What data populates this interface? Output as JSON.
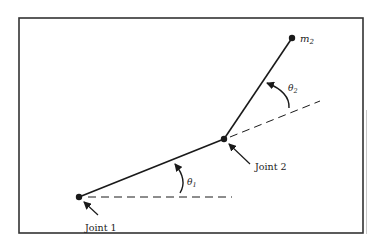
{
  "diagram": {
    "labels": {
      "joint1": "Joint 1",
      "joint2": "Joint 2",
      "mass": "m",
      "mass_sub": "2",
      "theta1": "θ",
      "theta1_sub": "1",
      "theta2": "θ",
      "theta2_sub": "2"
    },
    "points": {
      "joint1": [
        79,
        197
      ],
      "joint2": [
        224,
        139
      ],
      "mass": [
        292,
        38
      ]
    },
    "colors": {
      "line": "#1a1a1a",
      "frame": "#333333"
    }
  }
}
